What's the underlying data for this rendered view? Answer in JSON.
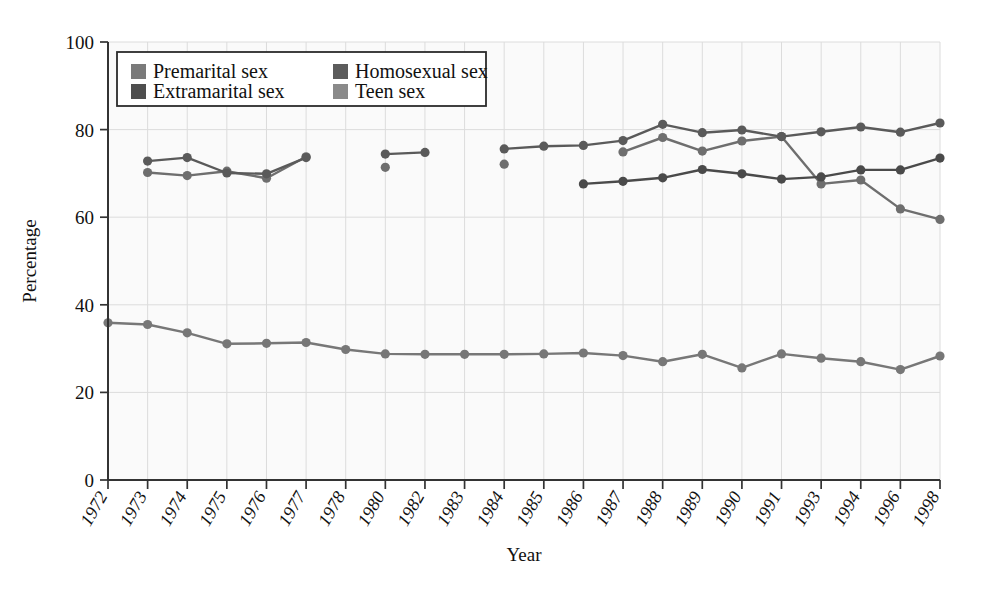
{
  "chart_data": {
    "type": "line",
    "title": "",
    "xlabel": "Year",
    "ylabel": "Percentage",
    "ylim": [
      0,
      100
    ],
    "yticks": [
      0,
      20,
      40,
      60,
      80,
      100
    ],
    "grid": true,
    "legend_position": "top-left",
    "categories": [
      "1972",
      "1973",
      "1974",
      "1975",
      "1976",
      "1977",
      "1978",
      "1980",
      "1982",
      "1983",
      "1984",
      "1985",
      "1986",
      "1987",
      "1988",
      "1989",
      "1990",
      "1991",
      "1993",
      "1994",
      "1996",
      "1998"
    ],
    "series": [
      {
        "name": "Premarital sex",
        "color": "#6e6e6e",
        "values": [
          null,
          70.2,
          69.5,
          70.5,
          68.9,
          73.8,
          null,
          71.4,
          null,
          null,
          72.1,
          null,
          null,
          74.9,
          78.2,
          75.1,
          77.4,
          78.4,
          67.6,
          68.5,
          61.9,
          59.5
        ]
      },
      {
        "name": "Extramarital sex",
        "color": "#5a5a5a",
        "values": [
          null,
          72.8,
          73.6,
          70.1,
          69.9,
          73.6,
          null,
          74.4,
          74.8,
          null,
          75.6,
          76.2,
          76.4,
          77.5,
          81.2,
          79.3,
          79.9,
          78.4,
          79.5,
          80.6,
          79.4,
          81.5
        ]
      },
      {
        "name": "Homosexual sex",
        "color": "#4a4a4a",
        "values": [
          null,
          null,
          null,
          null,
          null,
          null,
          null,
          null,
          null,
          null,
          null,
          null,
          67.6,
          68.2,
          69.0,
          70.9,
          69.9,
          68.7,
          69.2,
          70.8,
          70.8,
          73.5
        ]
      },
      {
        "name": "Teen sex",
        "color": "#777777",
        "values": [
          35.9,
          35.5,
          33.6,
          31.1,
          31.2,
          31.4,
          29.8,
          28.8,
          28.7,
          28.7,
          28.7,
          28.8,
          29.0,
          28.4,
          27.0,
          28.7,
          25.6,
          28.8,
          27.8,
          27.0,
          25.2,
          28.3
        ]
      }
    ],
    "all_xticks": [
      "1972",
      "1973",
      "1974",
      "1975",
      "1976",
      "1977",
      "1978",
      "1980",
      "1982",
      "1983",
      "1984",
      "1985",
      "1986",
      "1987",
      "1988",
      "1989",
      "1990",
      "1991",
      "1993",
      "1994",
      "1996",
      "1998"
    ]
  },
  "legend": {
    "entries": [
      {
        "label": "Premarital sex",
        "swatch": "#7a7a7a"
      },
      {
        "label": "Extramarital sex",
        "swatch": "#4e4e4e"
      },
      {
        "label": "Homosexual sex",
        "swatch": "#5c5c5c"
      },
      {
        "label": "Teen sex",
        "swatch": "#8a8a8a"
      }
    ]
  },
  "axes": {
    "y_title": "Percentage",
    "x_title": "Year",
    "y_ticks": [
      "0",
      "20",
      "40",
      "60",
      "80",
      "100"
    ]
  }
}
